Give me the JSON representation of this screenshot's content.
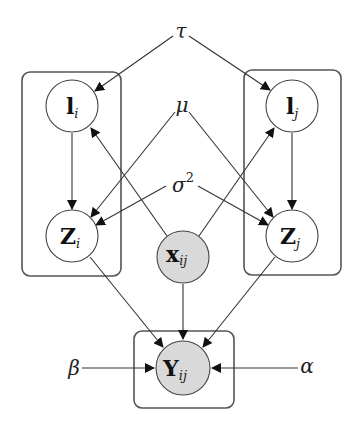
{
  "diagram": {
    "type": "probabilistic-graphical-model",
    "colors": {
      "observed_fill": "#d9d9d9",
      "latent_fill": "#ffffff",
      "stroke": "#444444",
      "plate_stroke": "#555555"
    },
    "parameters": {
      "tau": {
        "symbol": "τ"
      },
      "mu": {
        "symbol": "μ"
      },
      "sigma": {
        "symbol": "σ",
        "superscript": "2"
      },
      "beta": {
        "symbol": "β"
      },
      "alpha": {
        "symbol": "α"
      }
    },
    "nodes": {
      "l_i": {
        "base": "l",
        "sub": "i",
        "observed": false
      },
      "z_i": {
        "base": "Z",
        "sub": "i",
        "observed": false
      },
      "l_j": {
        "base": "l",
        "sub": "j",
        "observed": false
      },
      "z_j": {
        "base": "Z",
        "sub": "j",
        "observed": false
      },
      "x_ij": {
        "base": "x",
        "sub": "ij",
        "observed": true
      },
      "y_ij": {
        "base": "Y",
        "sub": "ij",
        "observed": true
      }
    },
    "plates": [
      "plate-i",
      "plate-j",
      "plate-ij"
    ],
    "edges": [
      [
        "τ",
        "l_i"
      ],
      [
        "τ",
        "l_j"
      ],
      [
        "μ",
        "Z_i"
      ],
      [
        "μ",
        "Z_j"
      ],
      [
        "σ²",
        "Z_i"
      ],
      [
        "σ²",
        "Z_j"
      ],
      [
        "l_i",
        "Z_i"
      ],
      [
        "l_j",
        "Z_j"
      ],
      [
        "x_ij",
        "l_i"
      ],
      [
        "x_ij",
        "l_j"
      ],
      [
        "Z_i",
        "Y_ij"
      ],
      [
        "x_ij",
        "Y_ij"
      ],
      [
        "Z_j",
        "Y_ij"
      ],
      [
        "β",
        "Y_ij"
      ],
      [
        "α",
        "Y_ij"
      ]
    ]
  }
}
